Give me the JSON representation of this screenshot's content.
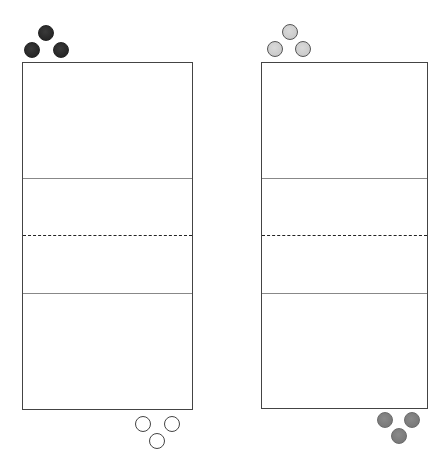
{
  "diagram": {
    "type": "two-court-team-positions",
    "courts": [
      {
        "id": "left",
        "x": 22,
        "y": 62,
        "width": 170,
        "height": 347,
        "lines": [
          {
            "style": "solid",
            "y": 116
          },
          {
            "style": "dashed",
            "y": 173
          },
          {
            "style": "solid",
            "y": 231
          }
        ]
      },
      {
        "id": "right",
        "x": 261,
        "y": 62,
        "width": 166,
        "height": 346,
        "lines": [
          {
            "style": "solid",
            "y": 116
          },
          {
            "style": "dashed",
            "y": 173
          },
          {
            "style": "solid",
            "y": 231
          }
        ]
      }
    ],
    "teams": [
      {
        "id": "team-dark",
        "color": "#222222",
        "positions": [
          [
            46,
            33
          ],
          [
            32,
            50
          ],
          [
            61,
            50
          ]
        ]
      },
      {
        "id": "team-light-gray",
        "color": "#cccccc",
        "positions": [
          [
            290,
            32
          ],
          [
            275,
            49
          ],
          [
            303,
            49
          ]
        ]
      },
      {
        "id": "team-white",
        "color": "#ffffff",
        "positions": [
          [
            143,
            424
          ],
          [
            172,
            424
          ],
          [
            157,
            441
          ]
        ]
      },
      {
        "id": "team-mid-gray",
        "color": "#7a7a7a",
        "positions": [
          [
            385,
            420
          ],
          [
            412,
            420
          ],
          [
            399,
            436
          ]
        ]
      }
    ]
  }
}
